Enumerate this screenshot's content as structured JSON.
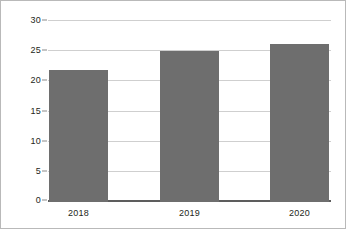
{
  "chart_data": {
    "type": "bar",
    "title": "",
    "subtitle": "",
    "xlabel": "",
    "ylabel": "",
    "categories": [
      "2018",
      "2019",
      "2020"
    ],
    "values": [
      21.8,
      25.0,
      26.2
    ],
    "series": [
      {
        "name": "",
        "values": [
          21.8,
          25.0,
          26.2
        ]
      }
    ],
    "ylim": [
      0,
      30
    ],
    "ytick_values": [
      0,
      5,
      10,
      15,
      20,
      25,
      30
    ],
    "ytick_labels": [
      "0",
      "5",
      "10",
      "15",
      "20",
      "25",
      "30"
    ],
    "grid": true,
    "legend": false,
    "legend_position": "none",
    "annotations": [],
    "colors": {
      "bar": "#6e6e6e",
      "gridline": "#cfcfcf",
      "baseline": "#5d5d5d",
      "frame": "#b9b9b9",
      "text": "#231f20",
      "background": "#ffffff"
    }
  }
}
